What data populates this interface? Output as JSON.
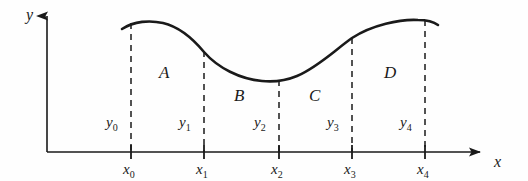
{
  "figure": {
    "background_color": "#fefefe",
    "ink_color": "#1a1a1a",
    "axes": {
      "y_axis_label": "y",
      "x_axis_label": "x",
      "origin": [
        47,
        152
      ],
      "y_axis_top": 10,
      "x_axis_right": 492
    },
    "x_ticks": [
      {
        "label": "x",
        "sub": "0",
        "x": 131
      },
      {
        "label": "x",
        "sub": "1",
        "x": 204
      },
      {
        "label": "x",
        "sub": "2",
        "x": 279
      },
      {
        "label": "x",
        "sub": "3",
        "x": 352
      },
      {
        "label": "x",
        "sub": "4",
        "x": 425
      }
    ],
    "y_ordinates": [
      {
        "label": "y",
        "sub": "0",
        "x": 113,
        "y": 124
      },
      {
        "label": "y",
        "sub": "1",
        "x": 186,
        "y": 124
      },
      {
        "label": "y",
        "sub": "2",
        "x": 261,
        "y": 124
      },
      {
        "label": "y",
        "sub": "3",
        "x": 334,
        "y": 124
      },
      {
        "label": "y",
        "sub": "4",
        "x": 407,
        "y": 124
      }
    ],
    "regions": [
      {
        "label": "A",
        "x": 165,
        "y": 78
      },
      {
        "label": "B",
        "x": 240,
        "y": 101
      },
      {
        "label": "C",
        "x": 315,
        "y": 101
      },
      {
        "label": "D",
        "x": 390,
        "y": 78
      }
    ],
    "curve": {
      "description": "smooth wave with maximum near x0-x1, minimum at x2, rising to maximum at x4",
      "path": "M 122,29 C 134,21 150,20 163,23 C 180,27 194,40 204,52 C 218,68 240,79 262,81 C 272,82 285,81 297,76 C 318,67 335,50 352,38 C 372,25 400,19 418,20 C 428,20 434,22 438,25",
      "stroke_width": 2.6
    },
    "dashed_lines": [
      {
        "x": 131,
        "y_top": 23,
        "y_bottom": 152
      },
      {
        "x": 204,
        "y_top": 51,
        "y_bottom": 152
      },
      {
        "x": 279,
        "y_top": 80,
        "y_bottom": 152
      },
      {
        "x": 352,
        "y_top": 38,
        "y_bottom": 152
      },
      {
        "x": 425,
        "y_top": 20,
        "y_bottom": 152
      }
    ]
  }
}
